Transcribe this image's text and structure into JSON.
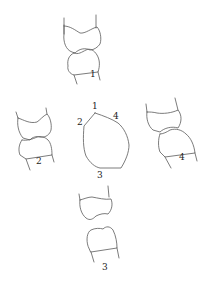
{
  "diagram": {
    "type": "tooth-views",
    "colors": {
      "stroke": "#5a5a5a",
      "text": "#222222",
      "background": "#ffffff"
    },
    "views": [
      {
        "id": "view-1",
        "label": "1",
        "position": "top"
      },
      {
        "id": "view-2",
        "label": "2",
        "position": "left"
      },
      {
        "id": "view-3",
        "label": "3",
        "position": "bottom"
      },
      {
        "id": "view-4",
        "label": "4",
        "position": "right"
      }
    ],
    "center_outline": {
      "vertex_labels": [
        "1",
        "2",
        "3",
        "4"
      ]
    }
  }
}
